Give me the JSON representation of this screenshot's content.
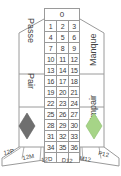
{
  "table": {
    "title": "French Roulette Betting Layout",
    "zero": "0",
    "number_rows": [
      [
        "1",
        "2",
        "3"
      ],
      [
        "4",
        "5",
        "6"
      ],
      [
        "7",
        "8",
        "9"
      ],
      [
        "10",
        "11",
        "12"
      ],
      [
        "13",
        "14",
        "15"
      ],
      [
        "16",
        "17",
        "18"
      ],
      [
        "19",
        "20",
        "21"
      ],
      [
        "22",
        "23",
        "24"
      ],
      [
        "25",
        "26",
        "27"
      ],
      [
        "28",
        "29",
        "30"
      ],
      [
        "31",
        "32",
        "33"
      ],
      [
        "34",
        "35",
        "36"
      ],
      [
        "",
        "",
        ""
      ]
    ],
    "left_bets": {
      "passe": "Passe",
      "pair": "Pair",
      "color_diamond": "noir-diamond"
    },
    "right_bets": {
      "manque": "Manque",
      "impair": "Impair",
      "color_diamond": "rouge-diamond"
    },
    "dozens_left": [
      "12P",
      "12M",
      "12D"
    ],
    "dozens_right": [
      "D12",
      "M12",
      "P12"
    ],
    "colors": {
      "noir": "#6f6f6f",
      "rouge": "#a6d487",
      "line": "#9a9a9a",
      "text": "#3a3a3a",
      "background": "#ffffff"
    }
  }
}
